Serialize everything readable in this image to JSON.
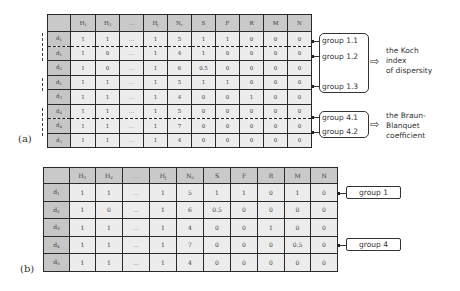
{
  "panel_a": {
    "label": "(a)",
    "columns": [
      "",
      "H1",
      "H2",
      "…",
      "Hj",
      "Nc",
      "S",
      "F",
      "R",
      "M",
      "N"
    ],
    "rows": [
      {
        "label": "d1",
        "values": [
          "1",
          "1",
          "…",
          "1",
          "5",
          "1",
          "1",
          "0",
          "0",
          "0"
        ]
      },
      {
        "label": "d1",
        "values": [
          "1",
          "0",
          "…",
          "1",
          "4",
          "1",
          "0",
          "0",
          "0",
          "0"
        ]
      },
      {
        "label": "d2",
        "values": [
          "1",
          "0",
          "…",
          "1",
          "6",
          "0.5",
          "0",
          "0",
          "0",
          "0"
        ]
      },
      {
        "label": "d1",
        "values": [
          "1",
          "1",
          "…",
          "1",
          "5",
          "1",
          "1",
          "0",
          "0",
          "0"
        ]
      },
      {
        "label": "d3",
        "values": [
          "1",
          "1",
          "…",
          "1",
          "4",
          "0",
          "0",
          "1",
          "0",
          "0"
        ]
      },
      {
        "label": "d4",
        "values": [
          "1",
          "1",
          "…",
          "1",
          "5",
          "0",
          "0",
          "0",
          "0",
          "0"
        ]
      },
      {
        "label": "d4",
        "values": [
          "1",
          "1",
          "…",
          "1",
          "7",
          "0",
          "0",
          "0",
          "0",
          "0"
        ]
      },
      {
        "label": "d5",
        "values": [
          "1",
          "1",
          "…",
          "1",
          "4",
          "0",
          "0",
          "0",
          "0",
          "0"
        ]
      }
    ],
    "groups": [
      {
        "label": "group 1.1"
      },
      {
        "label": "group 1.2"
      },
      {
        "label": "group 1.3"
      },
      {
        "label": "group 4.1"
      },
      {
        "label": "group 4.2"
      }
    ],
    "notes": {
      "koch": [
        "the Koch",
        "index",
        "of dispersity"
      ],
      "braun": [
        "the Braun-",
        "Blanquet",
        "coefficient"
      ]
    },
    "arrow_glyph": "⇨"
  },
  "panel_b": {
    "label": "(b)",
    "columns": [
      "",
      "H1",
      "H2",
      "…",
      "Hj",
      "Nc",
      "S",
      "F",
      "R",
      "M",
      "N"
    ],
    "rows": [
      {
        "label": "d1",
        "values": [
          "1",
          "1",
          "…",
          "1",
          "5",
          "1",
          "1",
          "0",
          "1",
          "0"
        ]
      },
      {
        "label": "d2",
        "values": [
          "1",
          "0",
          "…",
          "1",
          "6",
          "0.5",
          "0",
          "0",
          "0",
          "0"
        ]
      },
      {
        "label": "d3",
        "values": [
          "1",
          "1",
          "…",
          "1",
          "4",
          "0",
          "0",
          "1",
          "0",
          "0"
        ]
      },
      {
        "label": "d4",
        "values": [
          "1",
          "1",
          "…",
          "1",
          "7",
          "0",
          "0",
          "0",
          "0.5",
          "0"
        ]
      },
      {
        "label": "d5",
        "values": [
          "1",
          "1",
          "…",
          "1",
          "4",
          "0",
          "0",
          "0",
          "0",
          "0"
        ]
      }
    ],
    "groups": [
      {
        "label": "group 1"
      },
      {
        "label": "group 4"
      }
    ]
  }
}
